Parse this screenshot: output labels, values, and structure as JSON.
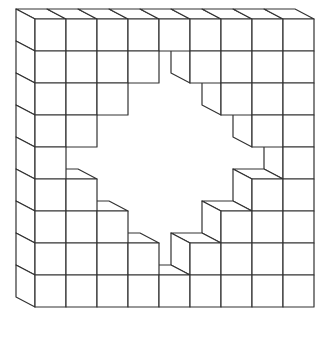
{
  "figure": {
    "rows": 9,
    "cols": 9,
    "grid": [
      [
        1,
        1,
        1,
        1,
        1,
        1,
        1,
        1,
        1
      ],
      [
        1,
        1,
        1,
        1,
        0,
        1,
        1,
        1,
        1
      ],
      [
        1,
        1,
        1,
        0,
        0,
        0,
        1,
        1,
        1
      ],
      [
        1,
        1,
        0,
        0,
        0,
        0,
        0,
        1,
        1
      ],
      [
        1,
        0,
        0,
        0,
        0,
        0,
        0,
        0,
        1
      ],
      [
        1,
        1,
        0,
        0,
        0,
        0,
        0,
        1,
        1
      ],
      [
        1,
        1,
        1,
        0,
        0,
        0,
        1,
        1,
        1
      ],
      [
        1,
        1,
        1,
        1,
        0,
        1,
        1,
        1,
        1
      ],
      [
        1,
        1,
        1,
        1,
        1,
        1,
        1,
        1,
        1
      ]
    ],
    "cube_count": 56,
    "line_color": "#333333",
    "background_color": "#ffffff"
  }
}
